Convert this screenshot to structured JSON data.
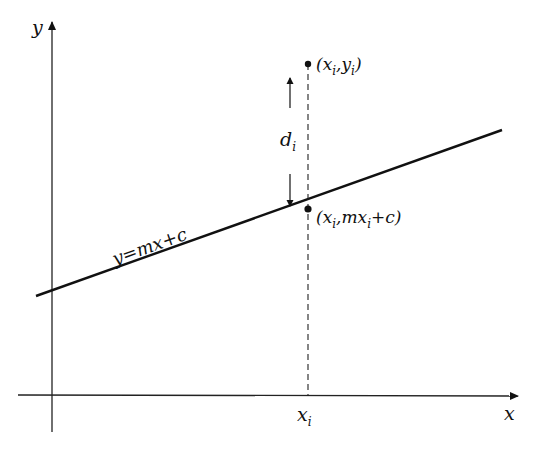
{
  "diagram": {
    "axes": {
      "x_label": "x",
      "y_label": "y"
    },
    "line": {
      "label": "y=mx+c",
      "equation_parts": {
        "lhs": "y",
        "eq": "=",
        "rhs": "mx+c"
      }
    },
    "data_point": {
      "label_open": "(x",
      "sub1": "i",
      "mid": ",y",
      "sub2": "i",
      "close": ")"
    },
    "fitted_point": {
      "label_open": "(x",
      "sub1": "i",
      "mid": ",mx",
      "sub2": "i",
      "close": "+c)"
    },
    "residual": {
      "label": "d",
      "sub": "i"
    },
    "x_tick": {
      "label": "x",
      "sub": "i"
    },
    "colors": {
      "ink": "#111111",
      "background": "#ffffff"
    }
  }
}
